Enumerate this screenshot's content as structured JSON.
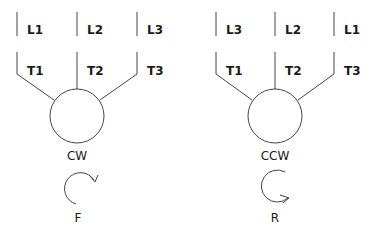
{
  "diagrams": [
    {
      "line_labels": [
        "L1",
        "L2",
        "L3"
      ],
      "terminal_labels": [
        "T1",
        "T2",
        "T3"
      ],
      "motor_label": "CW",
      "direction_label": "F"
    },
    {
      "line_labels": [
        "L3",
        "L2",
        "L1"
      ],
      "terminal_labels": [
        "T1",
        "T2",
        "T3"
      ],
      "motor_label": "CCW",
      "direction_label": "R"
    }
  ],
  "colors": {
    "line": "#444444",
    "text": "#1a1a1a",
    "background": "#ffffff"
  }
}
